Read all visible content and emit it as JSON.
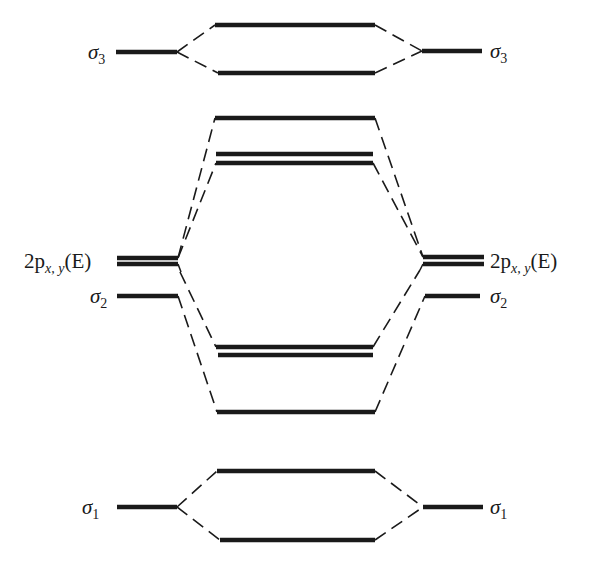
{
  "diagram": {
    "type": "molecular orbital correlation diagram",
    "labels": {
      "sigma3_left": {
        "sym": "σ",
        "sub": "3"
      },
      "sigma3_right": {
        "sym": "σ",
        "sub": "3"
      },
      "p_left": {
        "main": "2p",
        "sub": "x, y",
        "tail": "(E)"
      },
      "p_right": {
        "main": "2p",
        "sub": "x, y",
        "tail": "(E)"
      },
      "sigma2_left": {
        "sym": "σ",
        "sub": "2"
      },
      "sigma2_right": {
        "sym": "σ",
        "sub": "2"
      },
      "sigma1_left": {
        "sym": "σ",
        "sub": "1"
      },
      "sigma1_right": {
        "sym": "σ",
        "sub": "1"
      }
    },
    "levels": {
      "fragment_left": [
        {
          "name": "sigma3",
          "y": 52
        },
        {
          "name": "2p-xy-E",
          "y": [
            258,
            264
          ],
          "degenerate": true
        },
        {
          "name": "sigma2",
          "y": 296
        },
        {
          "name": "sigma1",
          "y": 507
        }
      ],
      "fragment_right": [
        {
          "name": "sigma3",
          "y": 51
        },
        {
          "name": "2p-xy-E",
          "y": [
            257,
            264
          ],
          "degenerate": true
        },
        {
          "name": "sigma2",
          "y": 296
        },
        {
          "name": "sigma1",
          "y": 507
        }
      ],
      "molecular": [
        {
          "name": "sigma3-antibonding",
          "y": 25
        },
        {
          "name": "sigma3-bonding",
          "y": 73
        },
        {
          "name": "high-level",
          "y": 118
        },
        {
          "name": "pi-antibonding-pair",
          "y": [
            154,
            163
          ],
          "degenerate": true
        },
        {
          "name": "pi-bonding-pair",
          "y": [
            347,
            355
          ],
          "degenerate": true
        },
        {
          "name": "low-level",
          "y": 412
        },
        {
          "name": "sigma1-antibonding",
          "y": 471
        },
        {
          "name": "sigma1-bonding",
          "y": 540
        }
      ]
    },
    "colors": {
      "ink": "#1a1a1a",
      "background": "#ffffff"
    }
  }
}
